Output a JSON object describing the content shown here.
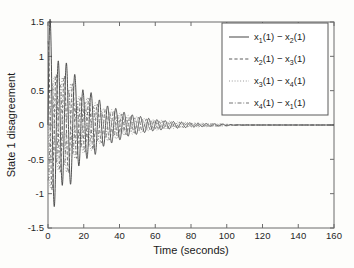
{
  "chart_data": {
    "type": "line",
    "title": "",
    "xlabel": "Time (seconds)",
    "ylabel": "State 1 disagreement",
    "xlim": [
      0,
      160
    ],
    "ylim": [
      -1.5,
      1.5
    ],
    "xticks": [
      0,
      20,
      40,
      60,
      80,
      100,
      120,
      140,
      160
    ],
    "yticks": [
      -1.5,
      -1,
      -0.5,
      0,
      0.5,
      1,
      1.5
    ],
    "xtick_labels": [
      "0",
      "20",
      "40",
      "60",
      "80",
      "100",
      "120",
      "140",
      "160"
    ],
    "ytick_labels": [
      "-1.5",
      "-1",
      "-0.5",
      "0",
      "0.5",
      "1",
      "1.5"
    ],
    "grid": false,
    "legend_position": "top-right",
    "series": [
      {
        "name": "x_1(1) - x_2(1)",
        "label_parts": [
          "x",
          "1",
          "(1) − ",
          "x",
          "2",
          "(1)"
        ],
        "style": "solid",
        "color": "#3c3c3c",
        "amplitude": 1.42,
        "decay_tau": 21.0,
        "period": 4.6,
        "phase": 0.0
      },
      {
        "name": "x_2(1) - x_3(1)",
        "label_parts": [
          "x",
          "2",
          "(1) − ",
          "x",
          "3",
          "(1)"
        ],
        "style": "dashed",
        "color": "#555555",
        "amplitude": 1.05,
        "decay_tau": 22.0,
        "period": 4.6,
        "phase": 1.6
      },
      {
        "name": "x_3(1) - x_4(1)",
        "label_parts": [
          "x",
          "3",
          "(1) − ",
          "x",
          "4",
          "(1)"
        ],
        "style": "dotted",
        "color": "#8a8a8a",
        "amplitude": 0.95,
        "decay_tau": 24.0,
        "period": 4.6,
        "phase": 3.1
      },
      {
        "name": "x_4(1) - x_1(1)",
        "label_parts": [
          "x",
          "4",
          "(1) − ",
          "x",
          "1",
          "(1)"
        ],
        "style": "dashdot",
        "color": "#6e6e6e",
        "amplitude": 0.78,
        "decay_tau": 23.0,
        "period": 4.6,
        "phase": 4.7
      }
    ],
    "settling_time": 100
  },
  "legend": {
    "entries": [
      {
        "line_style": "solid",
        "text": "x1(1) − x2(1)"
      },
      {
        "line_style": "dashed",
        "text": "x2(1) − x3(1)"
      },
      {
        "line_style": "dotted",
        "text": "x3(1) − x4(1)"
      },
      {
        "line_style": "dashdot",
        "text": "x4(1) − x1(1)"
      }
    ]
  },
  "colors": {
    "background": "#fdfdfb",
    "axis": "#6b6b6b",
    "text": "#1a1a1a",
    "legend_border": "#5a5a5a"
  }
}
